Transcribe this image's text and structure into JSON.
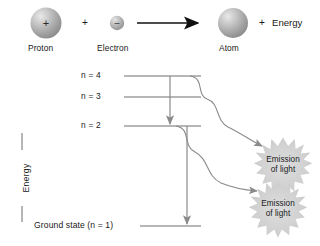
{
  "figure": {
    "background": "#ffffff",
    "line_color": "#6e6e6e",
    "arrow_color": "#7a7a7a",
    "reaction_arrow_color": "#111111",
    "burst_color": "#c9c9c9",
    "text_color": "#1a1a1a"
  },
  "reaction": {
    "proton": {
      "label": "Proton",
      "charge_glyph": "+"
    },
    "plus_operator": "+",
    "electron": {
      "label": "Electron",
      "charge_glyph": "–"
    },
    "arrow_icon": "right-arrow",
    "atom": {
      "label": "Atom"
    },
    "product_plus": "+",
    "product_energy": "Energy"
  },
  "axis": {
    "caption": "Energy"
  },
  "levels": [
    {
      "id": "n4",
      "label": "n = 4",
      "n": 4
    },
    {
      "id": "n3",
      "label": "n = 3",
      "n": 3
    },
    {
      "id": "n2",
      "label": "n = 2",
      "n": 2
    },
    {
      "id": "n1",
      "label": "Ground state (n = 1)",
      "n": 1
    }
  ],
  "transitions": [
    {
      "id": "t1",
      "from": "n = 4",
      "to": "n = 2",
      "arrow_icon": "down-arrow"
    },
    {
      "id": "t2",
      "from": "n = 2",
      "to": "n = 1",
      "arrow_icon": "down-arrow"
    }
  ],
  "emissions": [
    {
      "id": "e1",
      "line1": "Emission",
      "line2": "of light",
      "arrow_icon": "down-arrow"
    },
    {
      "id": "e2",
      "line1": "Emission",
      "line2": "of light",
      "arrow_icon": "down-arrow"
    }
  ]
}
